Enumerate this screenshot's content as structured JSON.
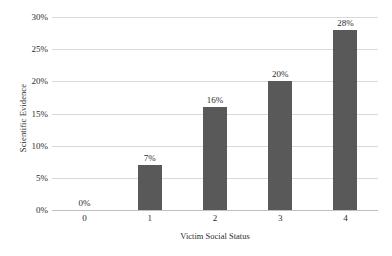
{
  "chart_data": {
    "type": "bar",
    "title": "",
    "xlabel": "Victim Social Status",
    "ylabel": "Scientific Evidence",
    "categories": [
      "0",
      "1",
      "2",
      "3",
      "4"
    ],
    "values": [
      0,
      7,
      16,
      20,
      28
    ],
    "data_labels": [
      "0%",
      "7%",
      "16%",
      "20%",
      "28%"
    ],
    "ylim": [
      0,
      30
    ],
    "yticks": [
      0,
      5,
      10,
      15,
      20,
      25,
      30
    ],
    "ytick_labels": [
      "0%",
      "5%",
      "10%",
      "15%",
      "20%",
      "25%",
      "30%"
    ],
    "grid": true,
    "legend": false,
    "bar_color": "#595959",
    "gridline_color": "#d9d9d9",
    "axis_color": "#bfbfbf",
    "background_color": "#ffffff",
    "text_color": "#2b2b2b"
  }
}
